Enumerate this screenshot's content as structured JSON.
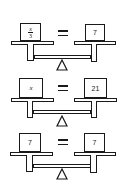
{
  "diagram": {
    "title": "",
    "balances": [
      {
        "id": "balance-1",
        "left": {
          "type": "fraction",
          "numerator": "x",
          "denominator": "3"
        },
        "relation": "=",
        "right": {
          "type": "number",
          "value": "7"
        }
      },
      {
        "id": "balance-2",
        "left": {
          "type": "variable",
          "value": "x"
        },
        "relation": "=",
        "right": {
          "type": "number",
          "value": "21"
        }
      },
      {
        "id": "balance-3",
        "left": {
          "type": "number",
          "value": "7"
        },
        "relation": "=",
        "right": {
          "type": "number",
          "value": "7"
        }
      }
    ],
    "colors": {
      "stroke": "#1a1a1a",
      "fill": "#ffffff"
    }
  }
}
